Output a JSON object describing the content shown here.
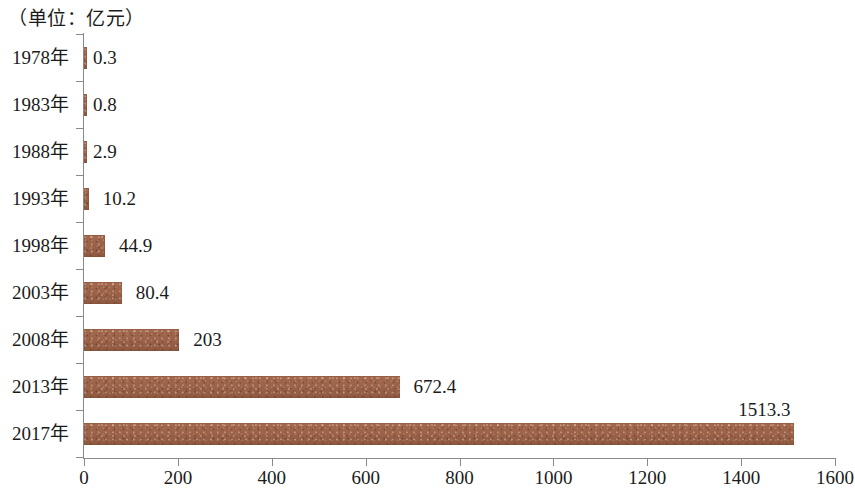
{
  "chart_data": {
    "type": "bar",
    "orientation": "horizontal",
    "title": "（单位：亿元）",
    "xlabel": "",
    "ylabel": "",
    "xlim": [
      0,
      1600
    ],
    "grid": false,
    "legend": null,
    "bar_color": "#9d6449",
    "axis_color": "#8a8a8a",
    "categories": [
      "1978年",
      "1983年",
      "1988年",
      "1993年",
      "1998年",
      "2003年",
      "2008年",
      "2013年",
      "2017年"
    ],
    "values": [
      0.3,
      0.8,
      2.9,
      10.2,
      44.9,
      80.4,
      203,
      672.4,
      1513.3
    ],
    "value_labels": [
      "0.3",
      "0.8",
      "2.9",
      "10.2",
      "44.9",
      "80.4",
      "203",
      "672.4",
      "1513.3"
    ],
    "xticks": [
      0,
      200,
      400,
      600,
      800,
      1000,
      1200,
      1400,
      1600
    ],
    "xtick_labels": [
      "0",
      "200",
      "400",
      "600",
      "800",
      "1000",
      "1200",
      "1400",
      "1600"
    ]
  },
  "rows": [
    {
      "category": "1978年",
      "value_label": "0.3",
      "value": 0.3
    },
    {
      "category": "1983年",
      "value_label": "0.8",
      "value": 0.8
    },
    {
      "category": "1988年",
      "value_label": "2.9",
      "value": 2.9
    },
    {
      "category": "1993年",
      "value_label": "10.2",
      "value": 10.2
    },
    {
      "category": "1998年",
      "value_label": "44.9",
      "value": 44.9
    },
    {
      "category": "2003年",
      "value_label": "80.4",
      "value": 80.4
    },
    {
      "category": "2008年",
      "value_label": "203",
      "value": 203
    },
    {
      "category": "2013年",
      "value_label": "672.4",
      "value": 672.4
    },
    {
      "category": "2017年",
      "value_label": "1513.3",
      "value": 1513.3
    }
  ]
}
